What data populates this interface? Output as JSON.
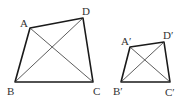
{
  "figure": {
    "width": 190,
    "height": 100,
    "background": "#ffffff",
    "line_color": "#1a1a1a",
    "quadrilaterals": [
      {
        "name": "ABCD",
        "vertices": {
          "A": {
            "x": 30,
            "y": 28
          },
          "B": {
            "x": 15,
            "y": 82
          },
          "C": {
            "x": 93,
            "y": 82
          },
          "D": {
            "x": 83,
            "y": 18
          }
        },
        "labels": {
          "A": {
            "text": "A",
            "x": 20,
            "y": 27
          },
          "B": {
            "text": "B",
            "x": 7,
            "y": 95
          },
          "C": {
            "text": "C",
            "x": 93,
            "y": 95
          },
          "D": {
            "text": "D",
            "x": 82,
            "y": 15
          }
        },
        "diagonals": [
          "AC",
          "BD"
        ]
      },
      {
        "name": "A'B'C'D'",
        "vertices": {
          "A": {
            "x": 130,
            "y": 47
          },
          "B": {
            "x": 121,
            "y": 82
          },
          "C": {
            "x": 170,
            "y": 82
          },
          "D": {
            "x": 164,
            "y": 42
          }
        },
        "labels": {
          "A": {
            "text": "A′",
            "x": 121,
            "y": 45
          },
          "B": {
            "text": "B′",
            "x": 113,
            "y": 95
          },
          "C": {
            "text": "C′",
            "x": 165,
            "y": 96
          },
          "D": {
            "text": "D′",
            "x": 163,
            "y": 39
          }
        },
        "diagonals": [
          "A'C'",
          "B'D'"
        ]
      }
    ]
  }
}
